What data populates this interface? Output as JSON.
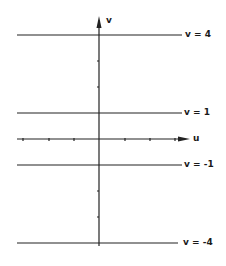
{
  "diagram": {
    "axes": {
      "vertical_label": "v",
      "horizontal_label": "u"
    },
    "lines": [
      {
        "label": "v = 4",
        "y": 35
      },
      {
        "label": "v = 1",
        "y": 113
      },
      {
        "label": "v = -1",
        "y": 165
      },
      {
        "label": "v = -4",
        "y": 243
      }
    ]
  }
}
